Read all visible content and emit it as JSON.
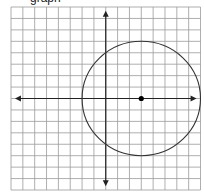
{
  "caption": "graph",
  "chart_data": {
    "type": "scatter",
    "title": "",
    "xlabel": "",
    "ylabel": "",
    "xlim": [
      -8,
      8
    ],
    "ylim": [
      -8,
      8
    ],
    "grid": true,
    "grid_step": 1,
    "axes": {
      "x_arrows": true,
      "y_arrows": true
    },
    "shapes": [
      {
        "kind": "circle",
        "center": [
          3,
          0
        ],
        "radius": 5
      }
    ],
    "points": [
      {
        "x": 3,
        "y": 0,
        "label": "center"
      }
    ]
  },
  "colors": {
    "grid": "#9a9a9a",
    "axes": "#222222",
    "circle": "#333333",
    "point": "#000000",
    "background": "#ffffff"
  }
}
